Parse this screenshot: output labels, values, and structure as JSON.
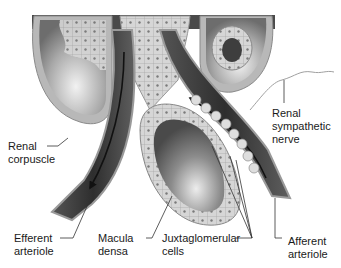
{
  "figure": {
    "labels": {
      "renal_corpuscle": "Renal\ncorpuscle",
      "renal_sympathetic_nerve": "Renal\nsympathetic\nnerve",
      "efferent_arteriole": "Efferent\narteriole",
      "macula_densa": "Macula\ndensa",
      "juxtaglomerular_cells": "Juxtaglomerular\ncells",
      "afferent_arteriole": "Afferent\narteriole"
    },
    "colors": {
      "vessel_dark": "#3a3a3a",
      "vessel_mid": "#6b6b6b",
      "tissue_light": "#c8c8c8",
      "cell_fill": "#dcdcdc",
      "nucleus": "#6a6a6a",
      "leader_line": "#333333",
      "text": "#1a1a1a"
    },
    "flow_arrows": [
      "efferent-outflow-arrow",
      "afferent-inflow-arrow"
    ]
  }
}
